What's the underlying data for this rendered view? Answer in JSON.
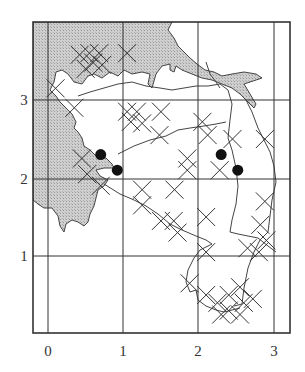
{
  "chart_data": {
    "type": "map",
    "title": "",
    "xlabel": "",
    "ylabel": "",
    "x_ticks": [
      "0",
      "1",
      "2",
      "3"
    ],
    "y_ticks": [
      "1",
      "2",
      "3"
    ],
    "xlim": [
      -0.2,
      3.2
    ],
    "ylim": [
      -0.05,
      3.9
    ],
    "grid": true,
    "legend": [],
    "sea_shading": "#c9c9c9",
    "line_color": "#333333",
    "point_records": [
      {
        "x": 0.7,
        "y": 2.3
      },
      {
        "x": 0.92,
        "y": 2.1
      },
      {
        "x": 2.3,
        "y": 2.3
      },
      {
        "x": 2.52,
        "y": 2.1
      }
    ],
    "cross_records": [
      [
        0.42,
        3.58
      ],
      [
        0.55,
        3.6
      ],
      [
        0.68,
        3.6
      ],
      [
        0.6,
        3.48
      ],
      [
        0.72,
        3.45
      ],
      [
        0.5,
        3.4
      ],
      [
        1.05,
        3.6
      ],
      [
        0.1,
        3.15
      ],
      [
        0.35,
        2.9
      ],
      [
        1.05,
        2.85
      ],
      [
        1.18,
        2.85
      ],
      [
        1.1,
        2.72
      ],
      [
        1.5,
        2.85
      ],
      [
        1.48,
        2.55
      ],
      [
        1.25,
        2.7
      ],
      [
        2.05,
        2.72
      ],
      [
        2.12,
        2.55
      ],
      [
        2.45,
        2.5
      ],
      [
        2.88,
        2.5
      ],
      [
        1.85,
        2.25
      ],
      [
        1.85,
        2.1
      ],
      [
        2.28,
        2.1
      ],
      [
        0.45,
        2.25
      ],
      [
        0.52,
        2.05
      ],
      [
        0.7,
        1.9
      ],
      [
        1.25,
        1.85
      ],
      [
        1.68,
        1.85
      ],
      [
        1.25,
        1.65
      ],
      [
        1.5,
        1.45
      ],
      [
        1.67,
        1.45
      ],
      [
        1.72,
        1.3
      ],
      [
        2.1,
        1.5
      ],
      [
        2.88,
        1.7
      ],
      [
        2.82,
        1.4
      ],
      [
        2.9,
        1.2
      ],
      [
        2.65,
        1.1
      ],
      [
        2.8,
        1.05
      ],
      [
        2.1,
        1.05
      ],
      [
        1.88,
        0.65
      ],
      [
        2.1,
        0.5
      ],
      [
        2.25,
        0.4
      ],
      [
        2.4,
        0.5
      ],
      [
        2.55,
        0.6
      ],
      [
        2.6,
        0.4
      ],
      [
        2.4,
        0.3
      ],
      [
        2.72,
        0.45
      ],
      [
        2.55,
        0.25
      ],
      [
        2.3,
        0.25
      ]
    ]
  }
}
